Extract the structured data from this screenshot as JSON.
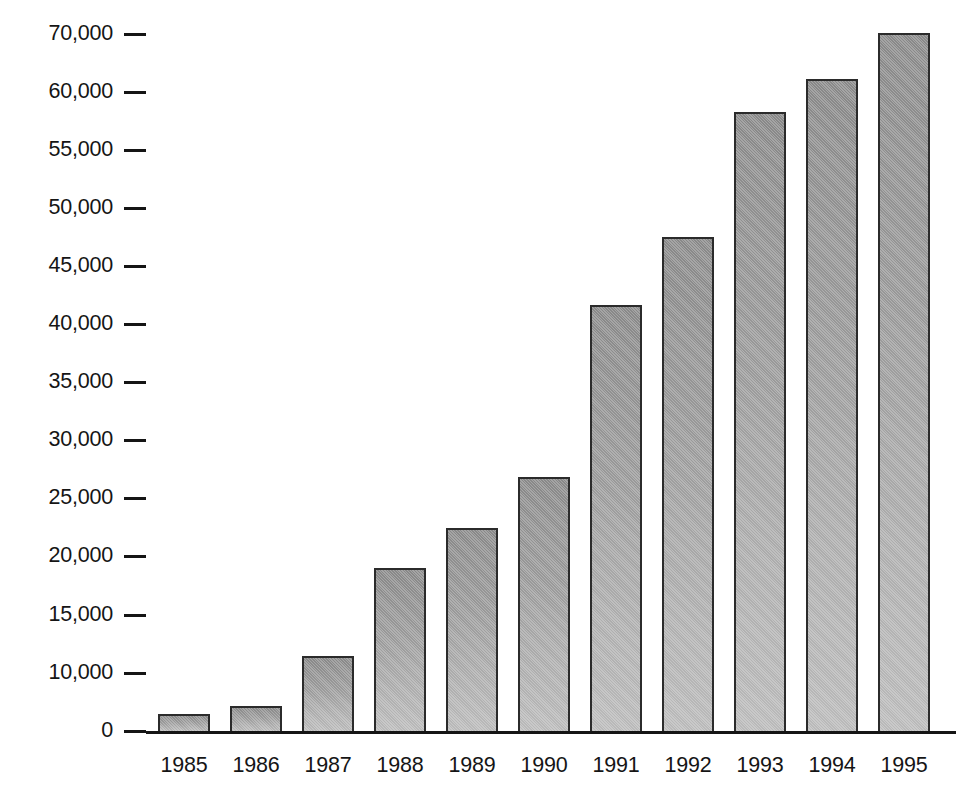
{
  "chart_data": {
    "type": "bar",
    "title": "",
    "subtitle": "",
    "xlabel": "",
    "ylabel": "",
    "grid": false,
    "legend": null,
    "categories": [
      "1985",
      "1986",
      "1987",
      "1988",
      "1989",
      "1990",
      "1991",
      "1992",
      "1993",
      "1994",
      "1995"
    ],
    "values": [
      3000,
      4300,
      11500,
      19000,
      22400,
      26800,
      41600,
      47500,
      58300,
      62300,
      70100
    ],
    "ytick_labels": [
      "70,000",
      "60,000",
      "55,000",
      "50,000",
      "45,000",
      "40,000",
      "35,000",
      "30,000",
      "25,000",
      "20,000",
      "15,000",
      "10,000",
      "0"
    ],
    "ytick_values": [
      70000,
      60000,
      55000,
      50000,
      45000,
      40000,
      35000,
      30000,
      25000,
      20000,
      15000,
      10000,
      0
    ],
    "ylim": [
      0,
      71000
    ],
    "xtick_labels": [
      "1985",
      "1986",
      "1987",
      "1988",
      "1989",
      "1990",
      "1991",
      "1992",
      "1993",
      "1994",
      "1995"
    ],
    "series": [
      {
        "name": "",
        "values": [
          3000,
          4300,
          11500,
          19000,
          22400,
          26800,
          41600,
          47500,
          58300,
          62300,
          70100
        ]
      }
    ],
    "bar_fill_light": "#bdbdbd",
    "bar_fill_dark": "#8e8e8e",
    "bar_outline_color": "#2b2b2b",
    "axis_color": "#151515",
    "background_color": "#ffffff"
  },
  "layout": {
    "baseline_y": 731,
    "plot_left": 146,
    "plot_width": 810,
    "tick_dash_width": 22,
    "bar_width": 52,
    "bar_pitch": 72,
    "first_bar_left": 12,
    "ytick_pixel_y": [
      34,
      150,
      208,
      266,
      324,
      382,
      440,
      498,
      556,
      615,
      673,
      731
    ],
    "ytick_pixel_y_all": [
      34,
      92,
      150,
      208,
      266,
      324,
      382,
      440,
      498,
      556,
      615,
      673,
      731
    ],
    "xlabel_y": 755
  }
}
